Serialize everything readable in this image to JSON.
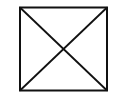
{
  "diagram": {
    "shape": "square-with-diagonals",
    "stroke_color": "#111111",
    "background": "#ffffff",
    "square": {
      "x": 20,
      "y": 7,
      "width": 87,
      "height": 84
    },
    "stroke_width": 2
  }
}
